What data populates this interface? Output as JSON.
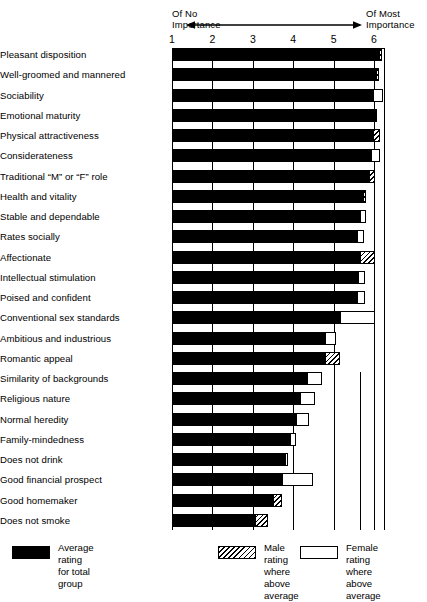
{
  "header": {
    "left_label": "Of No\nImportance",
    "right_label": "Of Most\nImportance",
    "arrow_icon": "double-headed-arrow-icon"
  },
  "axis": {
    "ticks": [
      "1",
      "2",
      "3",
      "4",
      "5",
      "6"
    ],
    "min": 1,
    "max": 6
  },
  "legend": {
    "items": [
      {
        "swatch": "solid-black",
        "label": "Average rating\nfor total group"
      },
      {
        "swatch": "diagonal-hatch",
        "label": "Male rating\nwhere above average"
      },
      {
        "swatch": "white-outline",
        "label": "Female rating\nwhere above average"
      }
    ]
  },
  "chart_data": {
    "type": "bar",
    "orientation": "horizontal",
    "title": "",
    "subtitle": "",
    "xlabel": "",
    "ylabel": "",
    "xlim": [
      1,
      6
    ],
    "grid": true,
    "legend_position": "bottom",
    "axis_annotations": {
      "left": "Of No Importance",
      "right": "Of Most Importance"
    },
    "tick_labels": [
      "1",
      "2",
      "3",
      "4",
      "5",
      "6"
    ],
    "categories": [
      "Pleasant disposition",
      "Well-groomed and mannered",
      "Sociability",
      "Emotional maturity",
      "Physical attractiveness",
      "Considerateness",
      "Traditional “M” or “F” role",
      "Health and vitality",
      "Stable and dependable",
      "Rates socially",
      "Affectionate",
      "Intellectual stimulation",
      "Poised and confident",
      "Conventional sex standards",
      "Ambitious and industrious",
      "Romantic appeal",
      "Similarity of backgrounds",
      "Religious nature",
      "Normal heredity",
      "Family-mindedness",
      "Does not drink",
      "Good financial prospect",
      "Good homemaker",
      "Does not smoke"
    ],
    "series": [
      {
        "name": "Average rating for total group",
        "style": "solid-black",
        "values": [
          6.12,
          6.04,
          5.98,
          6.07,
          5.98,
          5.93,
          5.88,
          5.72,
          5.65,
          5.57,
          5.65,
          5.6,
          5.57,
          5.17,
          4.78,
          4.78,
          4.33,
          4.16,
          4.08,
          3.92,
          3.8,
          3.73,
          3.49,
          3.05
        ]
      },
      {
        "name": "Male rating where above average",
        "style": "diagonal-hatch",
        "values": [
          6.2,
          6.12,
          null,
          null,
          6.15,
          null,
          6.02,
          5.78,
          null,
          null,
          6.02,
          null,
          null,
          null,
          null,
          5.15,
          null,
          null,
          null,
          null,
          null,
          null,
          3.73,
          3.37
        ]
      },
      {
        "name": "Female rating where above average",
        "style": "white-outline",
        "values": [
          null,
          null,
          6.23,
          null,
          null,
          6.15,
          null,
          null,
          5.8,
          5.75,
          null,
          5.78,
          5.78,
          6.02,
          5.07,
          null,
          4.72,
          4.55,
          4.38,
          4.06,
          3.87,
          4.48,
          null,
          null
        ]
      }
    ]
  }
}
